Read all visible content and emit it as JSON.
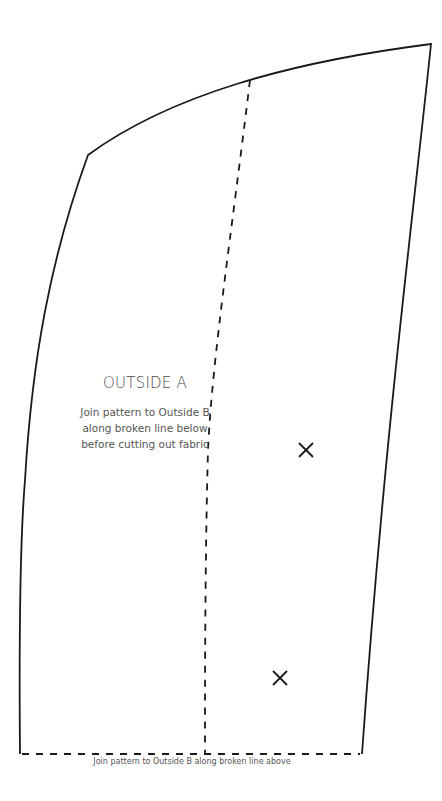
{
  "pattern": {
    "piece_name": "OUTSIDE A",
    "instructions": [
      "Join pattern to Outside B",
      "along broken line below",
      "before cutting out fabric"
    ],
    "bottom_caption": "Join pattern to Outside B along broken line above",
    "markers": [
      {
        "type": "cross-icon",
        "x": 306,
        "y": 450
      },
      {
        "type": "cross-icon",
        "x": 280,
        "y": 678
      }
    ],
    "lines": {
      "outline": "solid",
      "join_lines": "broken"
    },
    "colors": {
      "line": "#1a1a1a",
      "text": "#555555",
      "background": "#ffffff"
    }
  }
}
